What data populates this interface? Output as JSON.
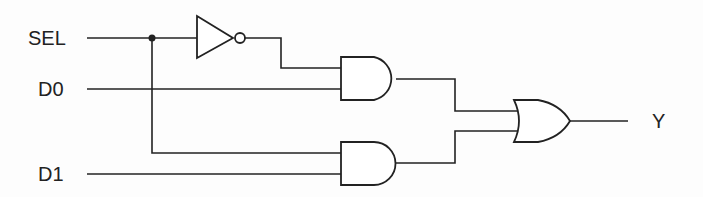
{
  "diagram": {
    "inputs": [
      {
        "id": "sel",
        "label": "SEL"
      },
      {
        "id": "d0",
        "label": "D0"
      },
      {
        "id": "d1",
        "label": "D1"
      }
    ],
    "output": {
      "id": "y",
      "label": "Y"
    },
    "gates": [
      {
        "id": "not1",
        "type": "NOT",
        "input": "SEL"
      },
      {
        "id": "and1",
        "type": "AND",
        "inputs": [
          "NOT SEL",
          "D0"
        ]
      },
      {
        "id": "and2",
        "type": "AND",
        "inputs": [
          "SEL",
          "D1"
        ]
      },
      {
        "id": "or1",
        "type": "OR",
        "inputs": [
          "and1",
          "and2"
        ],
        "output": "Y"
      }
    ],
    "colors": {
      "line": "#222222",
      "background": "#ffffff"
    }
  }
}
